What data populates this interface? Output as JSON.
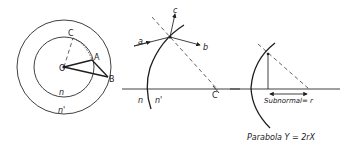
{
  "figure": {
    "panels": [
      {
        "id": "concentric-circles",
        "labels": {
          "center": "O",
          "point_c": "C",
          "point_a": "A",
          "point_b": "B",
          "inner_index": "n",
          "outer_index": "n'"
        }
      },
      {
        "id": "refraction-at-surface",
        "labels": {
          "ray_in": "a",
          "ray_out": "b",
          "ray_c": "c",
          "center": "C",
          "index_left": "n",
          "index_right": "n'"
        }
      },
      {
        "id": "parabola-subnormal",
        "labels": {
          "subnormal": "Subnormal= r",
          "caption": "Parabola  Y = 2rX"
        }
      }
    ],
    "colors": {
      "background": "#ffffff",
      "ink": "#1e1e1e"
    }
  }
}
